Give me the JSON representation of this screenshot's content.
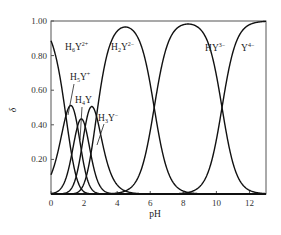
{
  "chart_data": {
    "type": "line",
    "title": "",
    "xlabel": "pH",
    "ylabel": "δ",
    "xlim": [
      0,
      13
    ],
    "ylim": [
      0,
      1.0
    ],
    "x_ticks": [
      "0",
      "2",
      "4",
      "6",
      "8",
      "10",
      "12"
    ],
    "y_ticks": [
      "0.20",
      "0.40",
      "0.60",
      "0.80",
      "1.00"
    ],
    "grid": false,
    "legend": "inline labels",
    "pKa": [
      0.9,
      1.6,
      2.07,
      2.75,
      6.24,
      10.34
    ],
    "series": [
      {
        "name": "H6Y2+",
        "base": "H",
        "sub": "6",
        "main": "Y",
        "sup": "2+",
        "peak_pH": 0,
        "peak_value": 0.88
      },
      {
        "name": "H5Y+",
        "base": "H",
        "sub": "5",
        "main": "Y",
        "sup": "+",
        "peak_pH": 1.25,
        "peak_value": 0.5
      },
      {
        "name": "H4Y",
        "base": "H",
        "sub": "4",
        "main": "Y",
        "sup": "",
        "peak_pH": 1.85,
        "peak_value": 0.4
      },
      {
        "name": "H3Y-",
        "base": "H",
        "sub": "3",
        "main": "Y",
        "sup": "−",
        "peak_pH": 2.4,
        "peak_value": 0.5
      },
      {
        "name": "H2Y2-",
        "base": "H",
        "sub": "2",
        "main": "Y",
        "sup": "2−",
        "peak_pH": 4.5,
        "peak_value": 0.97
      },
      {
        "name": "HY3-",
        "base": "H",
        "sub": "",
        "main": "Y",
        "sup": "3−",
        "peak_pH": 8.3,
        "peak_value": 0.99
      },
      {
        "name": "Y4-",
        "base": "",
        "sub": "",
        "main": "Y",
        "sup": "4−",
        "peak_pH": 13,
        "peak_value": 1.0
      }
    ]
  },
  "labels": {
    "x_axis": "pH",
    "y_axis": "δ"
  }
}
